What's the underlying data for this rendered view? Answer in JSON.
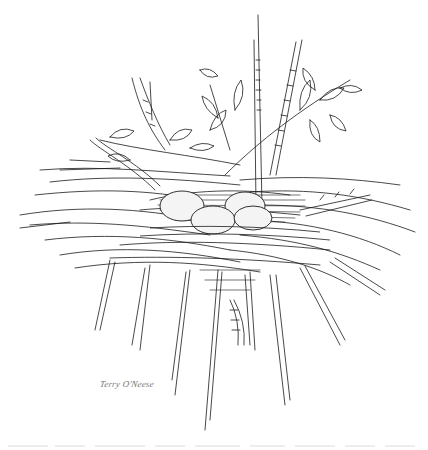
{
  "artwork": {
    "subject": "Bird nest with four eggs on branches, pen-and-ink illustration",
    "style": "black ink line drawing on white",
    "colors": {
      "background": "#ffffff",
      "ink": "#1a1a1a",
      "egg_fill": "#f4f4f4",
      "signature": "#777777"
    },
    "elements": {
      "eggs_count": 4,
      "branches": [
        "upper-left leafy twig",
        "central vertical branch",
        "upper-right leafy twig",
        "right horizontal branch",
        "lower hanging twigs"
      ]
    },
    "signature": "Terry O'Neese"
  }
}
